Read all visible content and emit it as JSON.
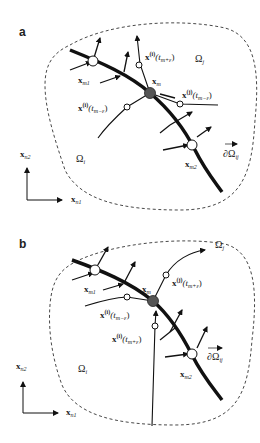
{
  "figure": {
    "panels": [
      {
        "label": "a",
        "region_i": "Ω",
        "region_i_sub": "i",
        "region_j": "Ω",
        "region_j_sub": "j",
        "boundary": "∂Ω",
        "boundary_sub": "ij",
        "point_m": "x",
        "point_m_sub": "m",
        "point_m1": "x",
        "point_m1_sub": "m1",
        "point_m2": "x",
        "point_m2_sub": "m2",
        "traj_upper": "x",
        "traj_upper_sup": "(i)",
        "traj_upper_arg": "(t",
        "traj_upper_arg_sub": "m+ε",
        "traj_upper_close": ")",
        "traj_left": "x",
        "traj_left_sup": "(i)",
        "traj_left_arg": "(t",
        "traj_left_arg_sub": "m−ε",
        "traj_left_close": ")",
        "traj_right": "x",
        "traj_right_sup": "(j)",
        "traj_right_arg": "(t",
        "traj_right_arg_sub": "m−ε",
        "traj_right_close": ")",
        "axis_x": "x",
        "axis_x_sub": "n1",
        "axis_y": "x",
        "axis_y_sub": "n2"
      },
      {
        "label": "b",
        "region_i": "Ω",
        "region_i_sub": "i",
        "region_j": "Ω",
        "region_j_sub": "j",
        "boundary": "∂Ω",
        "boundary_sub": "ij",
        "point_m": "x",
        "point_m_sub": "m",
        "point_m1": "x",
        "point_m1_sub": "m1",
        "point_m2": "x",
        "point_m2_sub": "m2",
        "traj_upper": "x",
        "traj_upper_sup": "(j)",
        "traj_upper_arg": "(t",
        "traj_upper_arg_sub": "m+ε",
        "traj_upper_close": ")",
        "traj_left": "x",
        "traj_left_sup": "(i)",
        "traj_left_arg": "(t",
        "traj_left_arg_sub": "m−ε",
        "traj_left_close": ")",
        "traj_lower": "x",
        "traj_lower_sup": "(i)",
        "traj_lower_arg": "(t",
        "traj_lower_arg_sub": "m+ε",
        "traj_lower_close": ")",
        "axis_x": "x",
        "axis_x_sub": "n1",
        "axis_y": "x",
        "axis_y_sub": "n2"
      }
    ],
    "colors": {
      "line": "#111111",
      "fill_point_m": "#555555",
      "open_point": "#ffffff",
      "dashed": "#333333"
    }
  }
}
